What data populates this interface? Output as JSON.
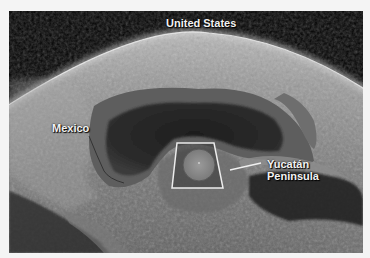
{
  "figure": {
    "type": "satellite-oblique-view",
    "region": "Gulf of Mexico",
    "labels": {
      "united_states": "United States",
      "mexico": "Mexico",
      "yucatan_line1": "Yucatán",
      "yucatan_line2": "Peninsula"
    },
    "highlight": {
      "shape": "trapezoid-frame-with-circle",
      "marks": "Chicxulub impact crater area"
    },
    "colors": {
      "frame_border": "#f4f4f4",
      "space": "#000000",
      "land_light": "#8a8a8a",
      "gulf_deep": "#2a2a2a",
      "shelf": "#5e5e5e",
      "label_text": "#f2f2f2",
      "highlight_stroke": "#e8e8e8"
    }
  }
}
